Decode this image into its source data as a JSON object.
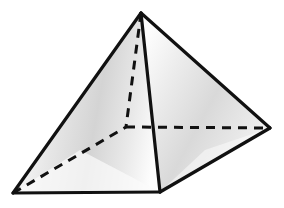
{
  "figure": {
    "name": "square-pyramid",
    "canvas": {
      "width": 284,
      "height": 208,
      "background": "#ffffff"
    }
  },
  "style": {
    "edge_color": "#111111",
    "edge_width": 3.2,
    "hidden_edge_color": "#111111",
    "hidden_edge_width": 3.0,
    "hidden_dash_pattern": "9 7",
    "face_light": "#fbfbfb",
    "face_mid": "#d8d8d8",
    "face_shadow": "#c6c6c6",
    "face_highlight": "#ffffff"
  },
  "vertices": {
    "apex": {
      "label": "apex",
      "x": 141,
      "y": 13,
      "hidden": false
    },
    "left": {
      "label": "base-left",
      "x": 13,
      "y": 193,
      "hidden": false
    },
    "front": {
      "label": "base-front",
      "x": 160,
      "y": 192,
      "hidden": false
    },
    "right": {
      "label": "base-right",
      "x": 270,
      "y": 128,
      "hidden": false
    },
    "back": {
      "label": "base-back",
      "x": 126,
      "y": 127,
      "hidden": true
    }
  },
  "faces": [
    {
      "name": "face-left",
      "points": "141,13 13,193 160,192",
      "fill": "url(#grad-left)",
      "visible": true
    },
    {
      "name": "face-right",
      "points": "141,13 160,192 270,128",
      "fill": "url(#grad-right)",
      "visible": true
    }
  ],
  "edges": [
    {
      "name": "edge-apex-left",
      "from": "apex",
      "to": "left",
      "hidden": false
    },
    {
      "name": "edge-apex-front",
      "from": "apex",
      "to": "front",
      "hidden": false
    },
    {
      "name": "edge-apex-right",
      "from": "apex",
      "to": "right",
      "hidden": false
    },
    {
      "name": "edge-base-left-front",
      "from": "left",
      "to": "front",
      "hidden": false
    },
    {
      "name": "edge-base-front-right",
      "from": "front",
      "to": "right",
      "hidden": false
    },
    {
      "name": "edge-apex-back",
      "from": "apex",
      "to": "back",
      "hidden": true
    },
    {
      "name": "edge-base-left-back",
      "from": "left",
      "to": "back",
      "hidden": true
    },
    {
      "name": "edge-base-back-right",
      "from": "back",
      "to": "right",
      "hidden": true
    }
  ]
}
